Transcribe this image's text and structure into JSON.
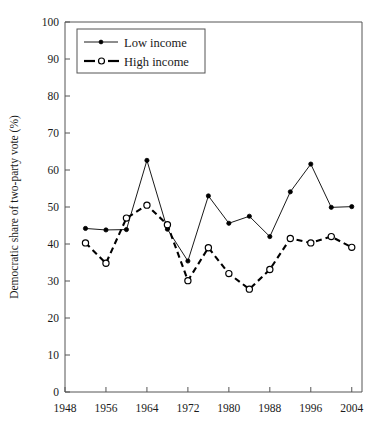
{
  "chart_data": {
    "type": "line",
    "title": "",
    "xlabel": "",
    "ylabel": "Democratic share of two-party vote (%)",
    "xlim": [
      1948,
      2006
    ],
    "ylim": [
      0,
      100
    ],
    "grid": false,
    "legend_position": "top-left",
    "x": [
      1952,
      1956,
      1960,
      1964,
      1968,
      1972,
      1976,
      1980,
      1984,
      1988,
      1992,
      1996,
      2000,
      2004
    ],
    "xticks": [
      1948,
      1956,
      1964,
      1972,
      1980,
      1988,
      1996,
      2004
    ],
    "yticks": [
      0,
      10,
      20,
      30,
      40,
      50,
      60,
      70,
      80,
      90,
      100
    ],
    "series": [
      {
        "name": "Low income",
        "marker": "filled-circle",
        "line_style": "solid",
        "color": "#000000",
        "values": [
          44.2,
          43.8,
          43.9,
          62.6,
          44.0,
          35.4,
          53.0,
          45.6,
          47.5,
          42.0,
          54.1,
          61.6,
          49.9,
          50.1
        ]
      },
      {
        "name": "High income",
        "marker": "open-circle",
        "line_style": "dashed",
        "color": "#000000",
        "values": [
          40.3,
          34.8,
          47.0,
          50.5,
          45.2,
          30.1,
          39.0,
          32.0,
          27.8,
          33.1,
          41.5,
          40.3,
          42.0,
          39.1
        ]
      }
    ]
  },
  "legend": {
    "entries": [
      {
        "label": "Low income"
      },
      {
        "label": "High income"
      }
    ]
  },
  "axes": {
    "y_title": "Democratic share of two-party vote (%)",
    "y_tick_labels": [
      "100",
      "90",
      "80",
      "70",
      "60",
      "50",
      "40",
      "30",
      "20",
      "10",
      "0"
    ],
    "x_tick_labels": [
      "1948",
      "1956",
      "1964",
      "1972",
      "1980",
      "1988",
      "1996",
      "2004"
    ]
  }
}
